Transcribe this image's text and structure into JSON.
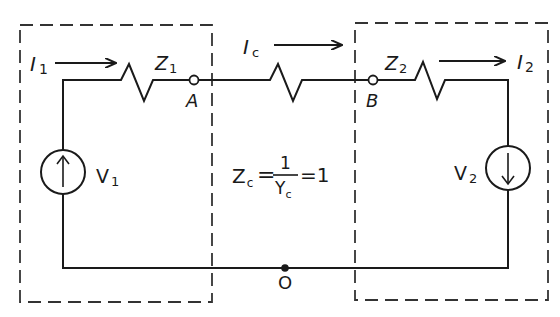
{
  "diagram": {
    "type": "circuit-schematic",
    "colors": {
      "ink": "#1a1a1a",
      "background": "#ffffff",
      "dashed_box": "#333333"
    },
    "currents": {
      "i1": {
        "symbol": "I",
        "sub": "1",
        "direction": "right"
      },
      "ic": {
        "symbol": "I",
        "sub": "c",
        "direction": "right"
      },
      "i2": {
        "symbol": "I",
        "sub": "2",
        "direction": "right"
      }
    },
    "impedances": {
      "z1": {
        "symbol": "Z",
        "sub": "1"
      },
      "zc": {
        "symbol": "Z",
        "sub": "c"
      },
      "z2": {
        "symbol": "Z",
        "sub": "2"
      }
    },
    "sources": {
      "v1": {
        "symbol": "V",
        "sub": "1",
        "arrow": "up"
      },
      "v2": {
        "symbol": "V",
        "sub": "2",
        "arrow": "down"
      }
    },
    "nodes": {
      "a": "A",
      "b": "B",
      "o": "O"
    },
    "equation": {
      "lhs_symbol": "Z",
      "lhs_sub": "c",
      "eq1": "=",
      "numerator": "1",
      "denominator_symbol": "Y",
      "denominator_sub": "c",
      "eq2": "=1"
    },
    "boxes": [
      "left-subsystem",
      "right-subsystem"
    ]
  }
}
